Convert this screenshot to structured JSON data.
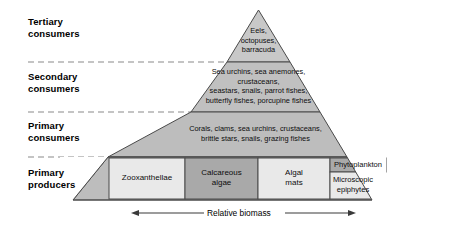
{
  "diagram": {
    "levels": [
      {
        "line1": "Tertiary",
        "line2": "consumers"
      },
      {
        "line1": "Secondary",
        "line2": "consumers"
      },
      {
        "line1": "Primary",
        "line2": "consumers"
      },
      {
        "line1": "Primary",
        "line2": "producers"
      }
    ],
    "tiers": [
      {
        "name": "tertiary-consumers",
        "lines": [
          "Eels,",
          "octopuses,",
          "barracuda"
        ]
      },
      {
        "name": "secondary-consumers",
        "lines": [
          "Sea urchins, sea anemones,",
          "crustaceans,",
          "seastars, snails, parrot fishes,",
          "butterfly fishes, porcupine fishes"
        ]
      },
      {
        "name": "primary-consumers",
        "lines": [
          "Corals, clams, sea urchins, crustaceans,",
          "brittle stars, snails, grazing fishes"
        ]
      }
    ],
    "producer_cells": [
      {
        "name": "zooxanthellae",
        "lines": [
          "Zooxanthellae"
        ]
      },
      {
        "name": "calcareous-algae",
        "lines": [
          "Calcareous",
          "algae"
        ]
      },
      {
        "name": "algal-mats",
        "lines": [
          "Algal",
          "mats"
        ]
      },
      {
        "name": "phytoplankton",
        "lines": [
          "Phytoplankton"
        ]
      },
      {
        "name": "microscopic-epiphytes",
        "lines": [
          "Microscopic",
          "epiphytes"
        ]
      }
    ],
    "axis": {
      "label": "Relative biomass"
    },
    "colors": {
      "pyramid_body": "#bdbdbd",
      "apex": "#c6c6c6",
      "cell_light": "#e9e9e9",
      "cell_mid": "#d0d0d0",
      "cell_dark": "#a9a9a9",
      "outline": "#4a4a4a",
      "dash": "#7a7a7a"
    }
  }
}
